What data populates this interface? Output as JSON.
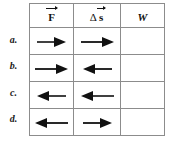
{
  "figure": {
    "type": "table"
  },
  "table": {
    "columns": [
      {
        "key": "force",
        "label_symbol": "F",
        "label_full": "F⃗",
        "vector": true,
        "italic": false
      },
      {
        "key": "displacement",
        "label_symbol": "s",
        "label_full": "Δ s⃗",
        "vector": true,
        "italic": false,
        "prefix": "Δ"
      },
      {
        "key": "work",
        "label_symbol": "W",
        "label_full": "W",
        "vector": false,
        "italic": true
      }
    ],
    "rows": [
      {
        "label": "a.",
        "force_direction": "right",
        "displacement_direction": "right",
        "force_length": "short",
        "displacement_length": "long",
        "work": ""
      },
      {
        "label": "b.",
        "force_direction": "right",
        "displacement_direction": "left",
        "force_length": "long",
        "displacement_length": "short",
        "work": ""
      },
      {
        "label": "c.",
        "force_direction": "left",
        "displacement_direction": "left",
        "force_length": "short",
        "displacement_length": "long",
        "work": ""
      },
      {
        "label": "d.",
        "force_direction": "left",
        "displacement_direction": "right",
        "force_length": "long",
        "displacement_length": "short",
        "work": ""
      }
    ]
  },
  "icons": {
    "arrow_right": "arrow-right-icon",
    "arrow_left": "arrow-left-icon"
  },
  "colors": {
    "border": "#8c8c8c",
    "ink": "#111111",
    "background": "#ffffff"
  }
}
